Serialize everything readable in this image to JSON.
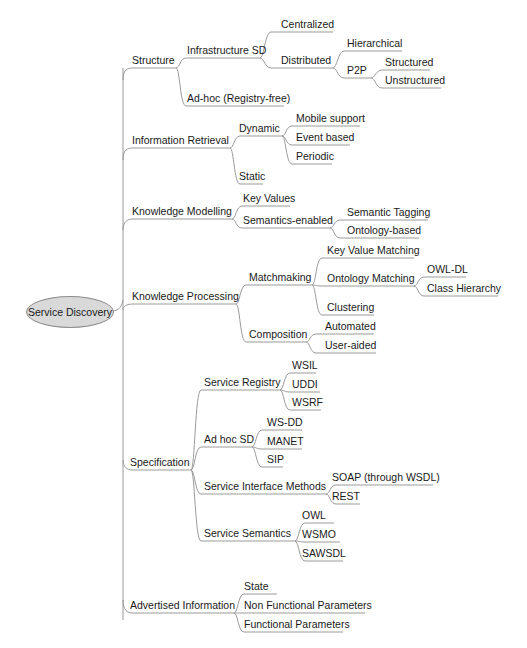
{
  "diagram": {
    "type": "mind-map",
    "line_color": "#9a9a9a",
    "root": {
      "label": "Service Discovery",
      "fill": "#d9d9d9"
    },
    "nodes": {
      "structure": "Structure",
      "infra_sd": "Infrastructure SD",
      "centralized": "Centralized",
      "distributed": "Distributed",
      "hierarchical": "Hierarchical",
      "p2p": "P2P",
      "structured": "Structured",
      "unstructured": "Unstructured",
      "adhoc_registry_free": "Ad-hoc (Registry-free)",
      "info_retrieval": "Information Retrieval",
      "dynamic": "Dynamic",
      "mobile_support": "Mobile support",
      "event_based": "Event based",
      "periodic": "Periodic",
      "static": "Static",
      "knowledge_modelling": "Knowledge Modelling",
      "key_values": "Key Values",
      "semantics_enabled": "Semantics-enabled",
      "semantic_tagging": "Semantic Tagging",
      "ontology_based": "Ontology-based",
      "knowledge_processing": "Knowledge Processing",
      "matchmaking": "Matchmaking",
      "key_value_matching": "Key Value Matching",
      "ontology_matching": "Ontology Matching",
      "owl_dl": "OWL-DL",
      "class_hierarchy": "Class Hierarchy",
      "clustering": "Clustering",
      "composition": "Composition",
      "automated": "Automated",
      "user_aided": "User-aided",
      "specification": "Specification",
      "service_registry": "Service Registry",
      "wsil": "WSIL",
      "uddi": "UDDI",
      "wsrf": "WSRF",
      "adhoc_sd": "Ad hoc SD",
      "ws_dd": "WS-DD",
      "manet": "MANET",
      "sip": "SIP",
      "service_interface_methods": "Service Interface Methods",
      "soap": "SOAP (through WSDL)",
      "rest": "REST",
      "service_semantics": "Service Semantics",
      "owl": "OWL",
      "wsmo": "WSMO",
      "sawsdl": "SAWSDL",
      "advertised_information": "Advertised Information",
      "state": "State",
      "non_functional_parameters": "Non Functional Parameters",
      "functional_parameters": "Functional Parameters"
    }
  }
}
